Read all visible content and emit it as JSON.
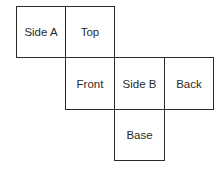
{
  "diagram": {
    "type": "cube-net",
    "faces": [
      {
        "label": "Side A",
        "row": 0,
        "col": 0
      },
      {
        "label": "Top",
        "row": 0,
        "col": 1
      },
      {
        "label": "Front",
        "row": 1,
        "col": 1
      },
      {
        "label": "Side B",
        "row": 1,
        "col": 2
      },
      {
        "label": "Back",
        "row": 1,
        "col": 3
      },
      {
        "label": "Base",
        "row": 2,
        "col": 2
      }
    ],
    "line_color": "#2a2a2a"
  }
}
